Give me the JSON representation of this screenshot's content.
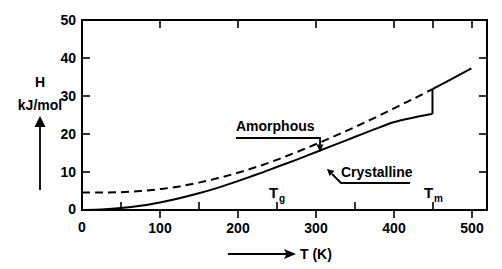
{
  "chart_data": {
    "type": "line",
    "title": "",
    "xlabel": "T (K)",
    "ylabel": "H",
    "ylabel_units": "kJ/mol",
    "xlim": [
      0,
      520
    ],
    "ylim": [
      0,
      50
    ],
    "grid": false,
    "legend": "inline-annotations",
    "x_ticks_major": [
      0,
      100,
      200,
      300,
      400,
      500
    ],
    "x_ticks_minor": [
      50,
      150,
      250,
      350,
      450
    ],
    "x_tick_labels": [
      "0",
      "100",
      "200",
      "300",
      "400",
      "500"
    ],
    "y_ticks_major": [
      0,
      10,
      20,
      30,
      40,
      50
    ],
    "y_tick_labels": [
      "0",
      "10",
      "20",
      "30",
      "40",
      "50"
    ],
    "series": [
      {
        "name": "Amorphous",
        "style": "dashed",
        "color": "#000000",
        "points": [
          [
            0,
            4.6
          ],
          [
            25,
            4.6
          ],
          [
            50,
            4.7
          ],
          [
            75,
            5.0
          ],
          [
            100,
            5.5
          ],
          [
            125,
            6.2
          ],
          [
            150,
            7.2
          ],
          [
            175,
            8.4
          ],
          [
            200,
            9.8
          ],
          [
            225,
            11.4
          ],
          [
            250,
            13.2
          ],
          [
            275,
            15.2
          ],
          [
            300,
            17.3
          ],
          [
            325,
            19.5
          ],
          [
            350,
            21.8
          ],
          [
            375,
            24.2
          ],
          [
            400,
            26.7
          ],
          [
            425,
            29.2
          ],
          [
            450,
            31.8
          ]
        ]
      },
      {
        "name": "Crystalline",
        "style": "solid",
        "color": "#000000",
        "points": [
          [
            0,
            0.0
          ],
          [
            25,
            0.15
          ],
          [
            50,
            0.5
          ],
          [
            75,
            1.1
          ],
          [
            100,
            2.0
          ],
          [
            125,
            3.1
          ],
          [
            150,
            4.4
          ],
          [
            175,
            5.9
          ],
          [
            200,
            7.6
          ],
          [
            225,
            9.4
          ],
          [
            250,
            11.3
          ],
          [
            275,
            13.2
          ],
          [
            300,
            15.2
          ],
          [
            325,
            17.2
          ],
          [
            350,
            19.2
          ],
          [
            375,
            21.2
          ],
          [
            400,
            23.1
          ],
          [
            425,
            24.3
          ],
          [
            450,
            25.3
          ]
        ]
      },
      {
        "name": "Liquid (post-melt)",
        "style": "solid",
        "color": "#000000",
        "points": [
          [
            450,
            31.8
          ],
          [
            475,
            34.5
          ],
          [
            500,
            37.3
          ]
        ]
      }
    ],
    "discontinuity": {
      "at_x": 450,
      "from_y": 25.3,
      "to_y": 31.8,
      "meaning": "latent heat of fusion at Tm"
    },
    "annotations": [
      {
        "label": "Amorphous",
        "points_to_series": "Amorphous",
        "at_x": 300,
        "at_y": 17.3
      },
      {
        "label": "Crystalline",
        "points_to_series": "Crystalline",
        "at_x": 300,
        "at_y": 15.2
      }
    ],
    "markers": [
      {
        "label": "T",
        "subscript": "g",
        "full": "Tg",
        "x": 250
      },
      {
        "label": "T",
        "subscript": "m",
        "full": "Tm",
        "x": 450
      }
    ]
  },
  "axis": {
    "y_label_main": "H",
    "y_label_units": "kJ/mol",
    "x_label": "T (K)",
    "y_tick_labels": [
      "0",
      "10",
      "20",
      "30",
      "40",
      "50"
    ],
    "x_tick_labels": [
      "0",
      "100",
      "200",
      "300",
      "400",
      "500"
    ],
    "x_origin_label": "0"
  },
  "annotations": {
    "amorphous": "Amorphous",
    "crystalline": "Crystalline"
  },
  "markers": {
    "tg_base": "T",
    "tg_sub": "g",
    "tm_base": "T",
    "tm_sub": "m"
  },
  "colors": {
    "ink": "#000000",
    "background": "#ffffff"
  }
}
